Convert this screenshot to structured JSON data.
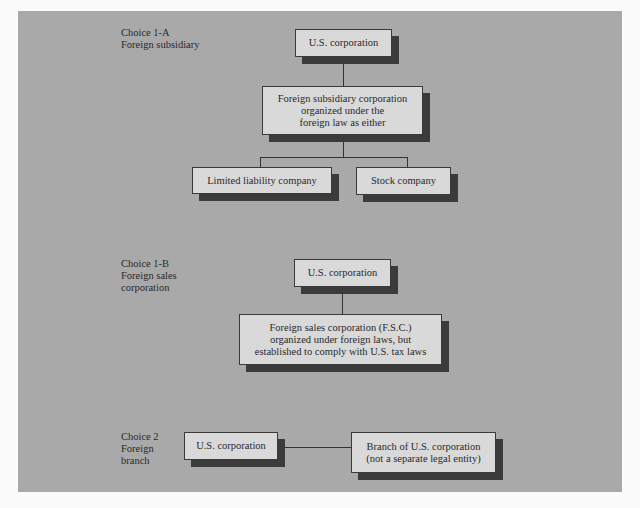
{
  "diagram": {
    "section_1a": {
      "label": "Choice 1-A\nForeign subsidiary",
      "parent": "U.S. corporation",
      "middle": "Foreign subsidiary corporation\norganized under the\nforeign law as either",
      "children": [
        "Limited liability company",
        "Stock company"
      ]
    },
    "section_1b": {
      "label": "Choice 1-B\nForeign sales\ncorporation",
      "parent": "U.S. corporation",
      "child": "Foreign sales corporation (F.S.C.)\norganized under foreign laws, but\nestablished to comply with U.S. tax laws"
    },
    "section_2": {
      "label": "Choice 2\nForeign\nbranch",
      "parent": "U.S. corporation",
      "child": "Branch of U.S. corporation\n(not a separate legal entity)"
    }
  },
  "colors": {
    "panel": "#a9a9a9",
    "box_fill": "#d9d9d9",
    "shadow": "#3b3b3b"
  }
}
